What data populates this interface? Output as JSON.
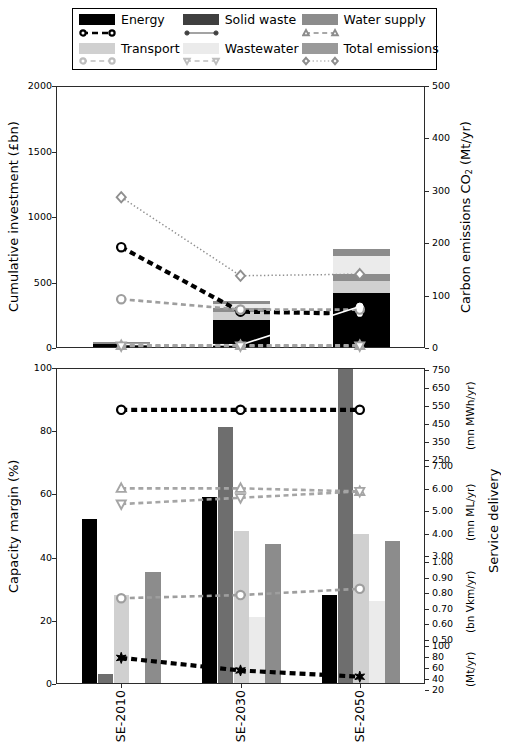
{
  "legend": {
    "entries": [
      {
        "label": "Energy",
        "color": "#000000",
        "marker": "circle-open",
        "linestyle": "dashed-heavy"
      },
      {
        "label": "Solid waste",
        "color": "#3f3f3f",
        "marker": "circle-filled",
        "linestyle": "solid"
      },
      {
        "label": "Water supply",
        "color": "#8c8c8c",
        "marker": "triangle-up",
        "linestyle": "dashed"
      },
      {
        "label": "Transport",
        "color": "#d0d0d0",
        "marker": "circle-open",
        "linestyle": "dashed"
      },
      {
        "label": "Wastewater",
        "color": "#ebebeb",
        "marker": "triangle-down",
        "linestyle": "dashed"
      },
      {
        "label": "Total emissions",
        "color": "#9a9a9a",
        "marker": "diamond-open",
        "linestyle": "dotted"
      }
    ]
  },
  "chart_data": [
    {
      "type": "bar",
      "panel": "top",
      "stacked": true,
      "categories": [
        "SE-2010",
        "SE-2030",
        "SE-2050"
      ],
      "ylabel": "Cumulative investment (£bn)",
      "ylim": [
        0,
        2000
      ],
      "yticks": [
        0,
        500,
        1000,
        1500,
        2000
      ],
      "y2label": "Carbon emissions CO₂ (Mt/yr)",
      "y2lim": [
        0,
        500
      ],
      "y2ticks": [
        0,
        100,
        200,
        300,
        400,
        500
      ],
      "series": [
        {
          "name": "Energy",
          "color": "#000000",
          "values": [
            38,
            225,
            430
          ]
        },
        {
          "name": "Transport",
          "color": "#d0d0d0",
          "values": [
            4,
            60,
            90
          ]
        },
        {
          "name": "Water supply",
          "color": "#8c8c8c",
          "values": [
            6,
            30,
            55
          ]
        },
        {
          "name": "Wastewater",
          "color": "#ebebeb",
          "values": [
            3,
            30,
            135
          ]
        },
        {
          "name": "Solid waste",
          "color": "#8c8c8c",
          "values": [
            2,
            18,
            55
          ]
        }
      ],
      "lines": [
        {
          "name": "Total emissions",
          "marker": "diamond-open",
          "linestyle": "dotted",
          "axis": "right",
          "values": [
            288,
            137,
            140
          ]
        },
        {
          "name": "Energy",
          "marker": "circle-open",
          "linestyle": "dashed-heavy",
          "axis": "right",
          "values": [
            192,
            68,
            64
          ]
        },
        {
          "name": "Transport",
          "marker": "circle-open",
          "linestyle": "dashed",
          "axis": "right",
          "values": [
            92,
            72,
            72
          ]
        },
        {
          "name": "Solid waste",
          "marker": "circle-filled",
          "linestyle": "solid",
          "axis": "right",
          "values": [
            5,
            4,
            78
          ]
        },
        {
          "name": "Water supply",
          "marker": "triangle-up",
          "linestyle": "dashed",
          "axis": "right",
          "values": [
            3,
            3,
            3
          ]
        },
        {
          "name": "Wastewater",
          "marker": "triangle-down",
          "linestyle": "dashed",
          "axis": "right",
          "values": [
            2,
            2,
            2
          ]
        }
      ]
    },
    {
      "type": "bar",
      "panel": "bottom",
      "stacked": false,
      "categories": [
        "SE-2010",
        "SE-2030",
        "SE-2050"
      ],
      "ylabel": "Capacity margin (%)",
      "ylim": [
        0,
        100
      ],
      "yticks": [
        0,
        20,
        40,
        60,
        80,
        100
      ],
      "y2label": "Service delivery",
      "y2groups": [
        {
          "unit": "(mn MWh/yr)",
          "ticks": [
            250,
            350,
            450,
            550,
            650,
            750
          ]
        },
        {
          "unit": "(mn ML/yr)",
          "ticks": [
            "3.00",
            "4.00",
            "5.00",
            "6.00",
            "7.00"
          ]
        },
        {
          "unit": "(bn Vkm/yr)",
          "ticks": [
            "0.50",
            "0.60",
            "0.70",
            "0.80",
            "0.90",
            "1.00"
          ]
        },
        {
          "unit": "(Mt/yr)",
          "ticks": [
            20,
            40,
            60,
            80,
            100
          ]
        }
      ],
      "series": [
        {
          "name": "Energy",
          "color": "#000000",
          "values": [
            52,
            59,
            28
          ]
        },
        {
          "name": "Solid waste",
          "color": "#6e6e6e",
          "values": [
            3,
            81,
            100
          ]
        },
        {
          "name": "Transport",
          "color": "#d0d0d0",
          "values": [
            28,
            48,
            47
          ]
        },
        {
          "name": "Wastewater",
          "color": "#ebebeb",
          "values": [
            null,
            21,
            26
          ]
        },
        {
          "name": "Water supply",
          "color": "#8c8c8c",
          "values": [
            35,
            44,
            45
          ]
        }
      ],
      "lines": [
        {
          "name": "Solid waste",
          "marker": "circle-open",
          "linestyle": "dashed-heavy",
          "values": [
            87,
            87,
            87
          ]
        },
        {
          "name": "Water supply",
          "marker": "triangle-up",
          "linestyle": "dashed",
          "values": [
            62,
            62,
            61
          ]
        },
        {
          "name": "Wastewater",
          "marker": "triangle-down",
          "linestyle": "dashed",
          "values": [
            57,
            59,
            61
          ]
        },
        {
          "name": "Transport",
          "marker": "circle-open",
          "linestyle": "dashed",
          "values": [
            27,
            28,
            30
          ]
        },
        {
          "name": "Energy",
          "marker": "star",
          "linestyle": "dashed-heavy",
          "values": [
            8,
            4,
            2
          ]
        }
      ]
    }
  ]
}
